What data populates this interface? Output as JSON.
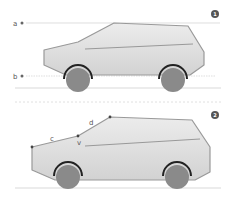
{
  "panels": [
    {
      "badge": "1",
      "labels": {
        "a": "a",
        "b": "b"
      }
    },
    {
      "badge": "2",
      "labels": {
        "c": "c",
        "d": "d",
        "v": "v"
      }
    }
  ],
  "colors": {
    "body_fill": "#dcdcdc",
    "body_stroke": "#999999",
    "wheel_fill": "#8a8a8a",
    "wheel_arch": "#222222",
    "guide_line": "#cccccc",
    "badge": "#555555"
  }
}
